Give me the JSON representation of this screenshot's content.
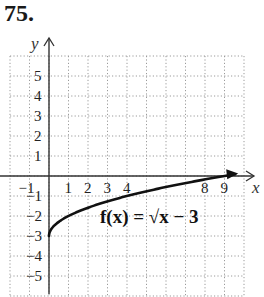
{
  "problem_number": "75.",
  "chart_data": {
    "type": "line",
    "title": "",
    "function_label": "f(x) = √x − 3",
    "xlabel": "x",
    "ylabel": "y",
    "xlim": [
      -2,
      10
    ],
    "ylim": [
      -6,
      6
    ],
    "grid": true,
    "grid_style": "dotted",
    "x_tick_labels": [
      "−1",
      "1",
      "2",
      "3",
      "4",
      "8",
      "9"
    ],
    "x_ticks": [
      -1,
      1,
      2,
      3,
      4,
      8,
      9
    ],
    "y_tick_labels": [
      "5",
      "4",
      "3",
      "2",
      "1",
      "−1",
      "−2",
      "−3",
      "−4",
      "−5"
    ],
    "y_ticks": [
      5,
      4,
      3,
      2,
      1,
      -1,
      -2,
      -3,
      -4,
      -5
    ],
    "series": [
      {
        "name": "f(x) = √x − 3",
        "x": [
          0,
          0.25,
          1,
          2,
          4,
          6,
          9,
          10
        ],
        "y": [
          -3,
          -2.5,
          -2,
          -1.59,
          -1,
          -0.55,
          0,
          0.16
        ],
        "start_point": [
          0,
          -3
        ],
        "arrow_end": true
      }
    ]
  },
  "colors": {
    "axis": "#333333",
    "grid": "#9a9a9a",
    "curve": "#111111",
    "text": "#222222"
  }
}
